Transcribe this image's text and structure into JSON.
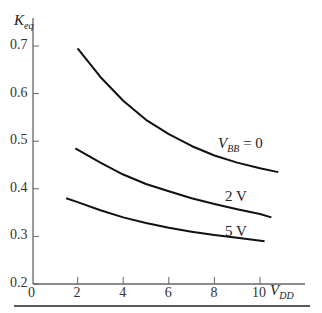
{
  "chart_data": {
    "type": "line",
    "title": "",
    "xlabel": "V_DD",
    "ylabel": "K_eq",
    "xlim": [
      0,
      11.5
    ],
    "ylim": [
      0.2,
      0.75
    ],
    "x_ticks": [
      "0",
      "2",
      "4",
      "6",
      "8",
      "10"
    ],
    "y_ticks": [
      "0.2",
      "0.3",
      "0.4",
      "0.5",
      "0.6",
      "0.7"
    ],
    "grid": false,
    "series": [
      {
        "name": "V_BB = 0",
        "x": [
          2,
          3,
          4,
          5,
          6,
          7,
          8,
          9,
          10,
          10.8
        ],
        "values": [
          0.695,
          0.635,
          0.585,
          0.545,
          0.515,
          0.49,
          0.47,
          0.455,
          0.443,
          0.435
        ]
      },
      {
        "name": "2 V",
        "x": [
          1.9,
          3,
          4,
          5,
          6,
          7,
          8,
          9,
          10,
          10.5
        ],
        "values": [
          0.485,
          0.455,
          0.43,
          0.41,
          0.395,
          0.38,
          0.368,
          0.357,
          0.347,
          0.34
        ]
      },
      {
        "name": "5 V",
        "x": [
          1.5,
          2,
          3,
          4,
          5,
          6,
          7,
          8,
          9,
          10.2
        ],
        "values": [
          0.38,
          0.372,
          0.355,
          0.34,
          0.328,
          0.318,
          0.31,
          0.303,
          0.297,
          0.29
        ]
      }
    ],
    "annotations": [
      "V_BB = 0",
      "2 V",
      "5 V"
    ]
  },
  "labels": {
    "ylabel_main": "K",
    "ylabel_sub": "eq",
    "xlabel_main": "V",
    "xlabel_sub": "DD",
    "s0_main": "V",
    "s0_sub": "BB",
    "s0_rest": " = 0",
    "s1": "2 V",
    "s2": "5 V"
  }
}
